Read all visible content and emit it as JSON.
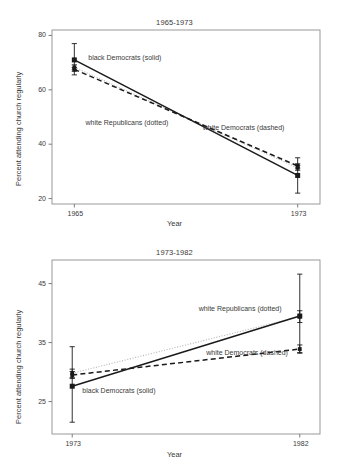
{
  "figure": {
    "background": "#ffffff",
    "ink": "#1a1a1a",
    "text_color": "#3a3a3a"
  },
  "chart_data": [
    {
      "type": "line",
      "title": "1965-1973",
      "xlabel": "Year",
      "ylabel": "Percent attending church regularly",
      "x": [
        1965,
        1973
      ],
      "xtick_labels": [
        "1965",
        "1973"
      ],
      "ytick_labels": [
        "80",
        "60",
        "40",
        "20"
      ],
      "yticks": [
        80,
        60,
        40,
        20
      ],
      "ylim": [
        18,
        82
      ],
      "xlim": [
        1964.2,
        1973.8
      ],
      "grid": false,
      "legend": "inline-annotations",
      "series": [
        {
          "name": "black Democrats (solid)",
          "style": "solid",
          "values": [
            71.0,
            28.5
          ],
          "errors_low": [
            65.5,
            22.0
          ],
          "errors_high": [
            77.0,
            35.0
          ],
          "marker": "square"
        },
        {
          "name": "white Democrats (dashed)",
          "style": "dashed",
          "values": [
            67.5,
            32.0
          ],
          "errors_low": [
            66.8,
            31.2
          ],
          "errors_high": [
            68.2,
            32.8
          ],
          "marker": "square"
        },
        {
          "name": "white Republicans (dotted)",
          "style": "dotted",
          "values": [
            68.3,
            31.3
          ],
          "errors_low": [
            67.4,
            30.4
          ],
          "errors_high": [
            69.2,
            32.2
          ],
          "marker": "square"
        }
      ],
      "annotations": [
        {
          "text": "black Democrats (solid)",
          "x": 1965.5,
          "y": 71.5
        },
        {
          "text": "white Republicans (dotted)",
          "x": 1965.4,
          "y": 47.5
        },
        {
          "text": "white Democrats (dashed)",
          "x": 1969.6,
          "y": 45.5
        }
      ]
    },
    {
      "type": "line",
      "title": "1973-1982",
      "xlabel": "Year",
      "ylabel": "Percent attending church regularly",
      "x": [
        1973,
        1982
      ],
      "xtick_labels": [
        "1973",
        "1982"
      ],
      "ytick_labels": [
        "45",
        "35",
        "25"
      ],
      "yticks": [
        45,
        35,
        25
      ],
      "ylim": [
        19.5,
        49.0
      ],
      "xlim": [
        1972.2,
        1982.8
      ],
      "grid": false,
      "legend": "inline-annotations",
      "series": [
        {
          "name": "black Democrats (solid)",
          "style": "solid",
          "values": [
            27.6,
            39.5
          ],
          "errors_low": [
            21.5,
            33.3
          ],
          "errors_high": [
            34.3,
            46.6
          ],
          "marker": "square"
        },
        {
          "name": "white Democrats (dashed)",
          "style": "dashed",
          "values": [
            29.5,
            33.9
          ],
          "errors_low": [
            28.9,
            33.2
          ],
          "errors_high": [
            30.1,
            34.6
          ],
          "marker": "square"
        },
        {
          "name": "white Republicans (dotted)",
          "style": "dotted",
          "values": [
            29.8,
            39.4
          ],
          "errors_low": [
            29.1,
            38.4
          ],
          "errors_high": [
            30.5,
            40.4
          ],
          "marker": "square"
        }
      ],
      "annotations": [
        {
          "text": "white Republicans (dotted)",
          "x": 1978.0,
          "y": 40.6
        },
        {
          "text": "white Democrats (dashed)",
          "x": 1978.3,
          "y": 33.0
        },
        {
          "text": "black Democrats (solid)",
          "x": 1973.4,
          "y": 26.6
        }
      ]
    }
  ]
}
